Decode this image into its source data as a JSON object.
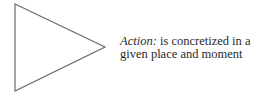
{
  "diagram": {
    "shape": "triangle",
    "stroke_color": "#6a6a6a",
    "label": {
      "term": "Action:",
      "line1_rest": " is concretized in a",
      "line2": "given place and moment"
    }
  }
}
